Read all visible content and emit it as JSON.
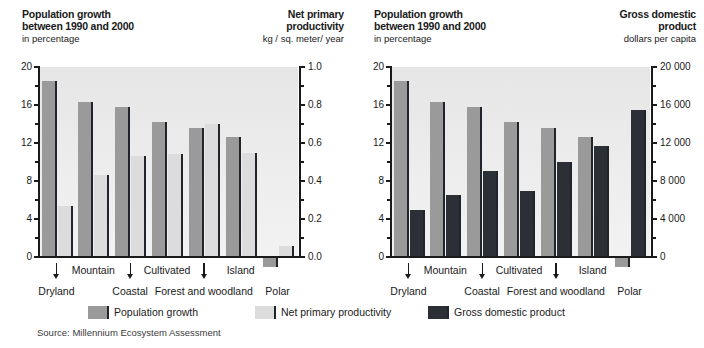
{
  "panels": {
    "left": {
      "left_axis_title_line1": "Population growth",
      "left_axis_title_line2": "between 1990 and 2000",
      "left_axis_units": "in percentage",
      "right_axis_title_line1": "Net primary",
      "right_axis_title_line2": "productivity",
      "right_axis_units": "kg / sq. meter/ year",
      "left_ticks": [
        "20",
        "16",
        "12",
        "8",
        "4",
        "0"
      ],
      "right_ticks": [
        "1.0",
        "0.8",
        "0.6",
        "0.4",
        "0.2",
        "0.0"
      ]
    },
    "right": {
      "left_axis_title_line1": "Population growth",
      "left_axis_title_line2": "between 1990 and 2000",
      "left_axis_units": "in percentage",
      "right_axis_title_line1": "Gross domestic",
      "right_axis_title_line2": "product",
      "right_axis_units": "dollars per capita",
      "left_ticks": [
        "20",
        "16",
        "12",
        "8",
        "4",
        "0"
      ],
      "right_ticks": [
        "20 000",
        "16 000",
        "12 000",
        "8 000",
        "4 000",
        "0"
      ]
    }
  },
  "categories": [
    "Dryland",
    "Mountain",
    "Coastal",
    "Cultivated",
    "Forest and woodland",
    "Island",
    "Polar"
  ],
  "legend": [
    {
      "key": "pop",
      "label": "Population growth",
      "color": "#9a9a9a"
    },
    {
      "key": "npp",
      "label": "Net primary productivity",
      "color": "#dcdcdc"
    },
    {
      "key": "gdp",
      "label": "Gross domestic product",
      "color": "#2c2f35"
    }
  ],
  "source": {
    "label": "Source:",
    "text": "Millennium Ecosystem Assessment"
  },
  "chart_data": [
    {
      "type": "bar",
      "title": "Population growth between 1990 and 2000 / Net primary productivity",
      "panel": "left",
      "categories": [
        "Dryland",
        "Mountain",
        "Coastal",
        "Cultivated",
        "Forest and woodland",
        "Island",
        "Polar"
      ],
      "series": [
        {
          "name": "Population growth",
          "axis": "left",
          "unit": "percent",
          "color": "#9a9a9a",
          "values": [
            18.5,
            16.3,
            15.8,
            14.2,
            13.6,
            12.6,
            -1.0
          ]
        },
        {
          "name": "Net primary productivity",
          "axis": "right",
          "unit": "kg/sq. meter/year",
          "color": "#dcdcdc",
          "values": [
            0.27,
            0.43,
            0.53,
            0.54,
            0.7,
            0.55,
            0.06
          ]
        }
      ],
      "xlabel": "",
      "ylabel": "in percentage",
      "y2label": "kg / sq. meter/ year",
      "ylim": [
        0,
        20
      ],
      "y2lim": [
        0.0,
        1.0
      ],
      "yticks": [
        0,
        4,
        8,
        12,
        16,
        20
      ],
      "y2ticks": [
        0.0,
        0.2,
        0.4,
        0.6,
        0.8,
        1.0
      ],
      "grid": false,
      "legend_position": "bottom"
    },
    {
      "type": "bar",
      "title": "Population growth between 1990 and 2000 / Gross domestic product",
      "panel": "right",
      "categories": [
        "Dryland",
        "Mountain",
        "Coastal",
        "Cultivated",
        "Forest and woodland",
        "Island",
        "Polar"
      ],
      "series": [
        {
          "name": "Population growth",
          "axis": "left",
          "unit": "percent",
          "color": "#9a9a9a",
          "values": [
            18.5,
            16.3,
            15.8,
            14.2,
            13.6,
            12.6,
            -1.0
          ]
        },
        {
          "name": "Gross domestic product",
          "axis": "right",
          "unit": "dollars per capita",
          "color": "#2c2f35",
          "values": [
            5000,
            6500,
            9100,
            7000,
            10000,
            11700,
            15500
          ]
        }
      ],
      "xlabel": "",
      "ylabel": "in percentage",
      "y2label": "dollars per capita",
      "ylim": [
        0,
        20
      ],
      "y2lim": [
        0,
        20000
      ],
      "yticks": [
        0,
        4,
        8,
        12,
        16,
        20
      ],
      "y2ticks": [
        0,
        4000,
        8000,
        12000,
        16000,
        20000
      ],
      "grid": false,
      "legend_position": "bottom"
    }
  ]
}
